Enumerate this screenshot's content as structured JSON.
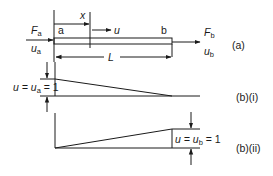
{
  "figure": {
    "panel_a": {
      "tag": "(a)",
      "node_a_label": "a",
      "node_b_label": "b",
      "position_var": "x",
      "displacement_var": "u",
      "length_label": "L",
      "force_a": {
        "main": "F",
        "sub": "a"
      },
      "disp_a": {
        "main": "u",
        "sub": "a"
      },
      "force_b": {
        "main": "F",
        "sub": "b"
      },
      "disp_b": {
        "main": "u",
        "sub": "b"
      }
    },
    "panel_b_i": {
      "tag": "(b)(i)",
      "value_label": {
        "pre": "u = u",
        "sub": "a",
        "post": " = 1"
      }
    },
    "panel_b_ii": {
      "tag": "(b)(ii)",
      "value_label": {
        "pre": "u = u",
        "sub": "b",
        "post": " = 1"
      }
    }
  },
  "colors": {
    "line": "#1a1a1a",
    "background": "#ffffff"
  }
}
